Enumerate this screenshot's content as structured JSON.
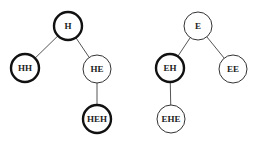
{
  "diagram": {
    "type": "tree",
    "colors": {
      "edge": "#555555",
      "node_border": "#111111",
      "node_fill": "#ffffff",
      "text": "#222222"
    },
    "node_radius": 14,
    "trees": [
      {
        "root": "H",
        "nodes": [
          {
            "id": "H",
            "label": "H",
            "x": 68,
            "y": 26,
            "emphasis": "thick"
          },
          {
            "id": "HH",
            "label": "HH",
            "x": 25,
            "y": 68,
            "emphasis": "thick"
          },
          {
            "id": "HE",
            "label": "HE",
            "x": 97,
            "y": 69,
            "emphasis": "thin"
          },
          {
            "id": "HEH",
            "label": "HEH",
            "x": 97,
            "y": 119,
            "emphasis": "thick"
          }
        ],
        "edges": [
          {
            "from": "H",
            "to": "HH"
          },
          {
            "from": "H",
            "to": "HE"
          },
          {
            "from": "HE",
            "to": "HEH"
          }
        ]
      },
      {
        "root": "E",
        "nodes": [
          {
            "id": "E",
            "label": "E",
            "x": 198,
            "y": 26,
            "emphasis": "thin"
          },
          {
            "id": "EH",
            "label": "EH",
            "x": 170,
            "y": 68,
            "emphasis": "thick"
          },
          {
            "id": "EE",
            "label": "EE",
            "x": 233,
            "y": 69,
            "emphasis": "thin"
          },
          {
            "id": "EHE",
            "label": "EHE",
            "x": 171,
            "y": 119,
            "emphasis": "thin"
          }
        ],
        "edges": [
          {
            "from": "E",
            "to": "EH"
          },
          {
            "from": "E",
            "to": "EE"
          },
          {
            "from": "EH",
            "to": "EHE"
          }
        ]
      }
    ]
  }
}
